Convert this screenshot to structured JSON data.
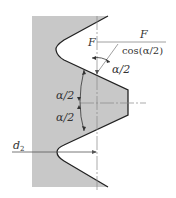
{
  "diagram": {
    "type": "thread-profile-force-diagram",
    "labels": {
      "force": "F",
      "force_normal_num": "F",
      "force_normal_den": "cos(α/2)",
      "half_angle_top": "α/2",
      "half_angle_mid_upper": "α/2",
      "half_angle_mid_lower": "α/2",
      "pitch_diameter": "d",
      "pitch_diameter_sub": "2"
    },
    "colors": {
      "fill": "#c8c8c8",
      "outline": "#222222",
      "centerline": "#888888",
      "text": "#333333"
    }
  }
}
